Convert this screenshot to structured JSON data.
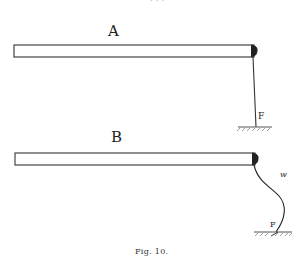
{
  "figure": {
    "caption": "Fig. 10.",
    "panels": [
      {
        "label": "A",
        "anchor_label": "F",
        "cord": "straight"
      },
      {
        "label": "B",
        "anchor_label": "F",
        "cord_label": "w",
        "cord": "curved"
      }
    ],
    "top_fragment": "· · ·"
  }
}
